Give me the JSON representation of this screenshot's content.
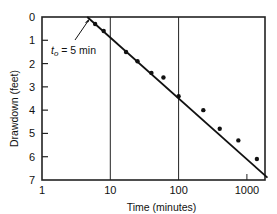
{
  "chart_data": {
    "type": "scatter",
    "title": "",
    "xlabel": "Time (minutes)",
    "ylabel": "Drawdown (feet)",
    "xscale": "log",
    "xlim": [
      1,
      2000
    ],
    "ylim": [
      7,
      0
    ],
    "y_inverted": true,
    "grid": "vertical lines at decades",
    "x_ticks": [
      "1",
      "10",
      "100",
      "1000"
    ],
    "y_ticks": [
      "0",
      "1",
      "2",
      "3",
      "4",
      "5",
      "6",
      "7"
    ],
    "series": [
      {
        "name": "Observed drawdown",
        "type": "scatter",
        "points": [
          {
            "x": 6,
            "y": 0.3
          },
          {
            "x": 8,
            "y": 0.6
          },
          {
            "x": 17,
            "y": 1.5
          },
          {
            "x": 25,
            "y": 1.9
          },
          {
            "x": 40,
            "y": 2.4
          },
          {
            "x": 60,
            "y": 2.6
          },
          {
            "x": 100,
            "y": 3.4
          },
          {
            "x": 230,
            "y": 4.0
          },
          {
            "x": 400,
            "y": 4.8
          },
          {
            "x": 750,
            "y": 5.3
          },
          {
            "x": 1400,
            "y": 6.1
          }
        ]
      },
      {
        "name": "Fitted straight line",
        "type": "line",
        "points": [
          {
            "x": 4.6,
            "y": 0
          },
          {
            "x": 2000,
            "y": 6.9
          }
        ]
      }
    ],
    "annotations": [
      {
        "text_main": "t",
        "text_sub": "o",
        "text_rest": " = 5 min",
        "points_to": {
          "x": 5,
          "y": 0
        }
      }
    ]
  }
}
